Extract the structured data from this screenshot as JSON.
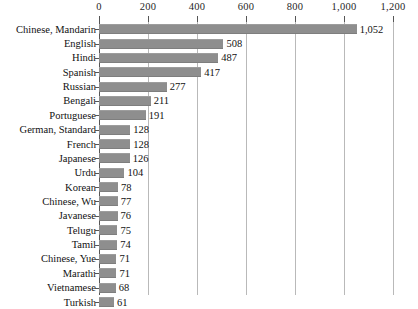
{
  "chart_data": {
    "type": "bar",
    "orientation": "horizontal",
    "title": "",
    "subtitle": "",
    "xlabel": "",
    "ylabel": "",
    "xlim": [
      0,
      1200
    ],
    "grid": true,
    "legend": null,
    "axis_position": "top",
    "value_labels_shown": true,
    "categories": [
      "Chinese, Mandarin",
      "English",
      "Hindi",
      "Spanish",
      "Russian",
      "Bengali",
      "Portuguese",
      "German, Standard",
      "French",
      "Japanese",
      "Urdu",
      "Korean",
      "Chinese, Wu",
      "Javanese",
      "Telugu",
      "Tamil",
      "Chinese, Yue",
      "Marathi",
      "Vietnamese",
      "Turkish"
    ],
    "values": [
      1052,
      508,
      487,
      417,
      277,
      211,
      191,
      128,
      128,
      126,
      104,
      78,
      77,
      76,
      75,
      74,
      71,
      71,
      68,
      61
    ],
    "value_labels": [
      "1,052",
      "508",
      "487",
      "417",
      "277",
      "211",
      "191",
      "128",
      "128",
      "126",
      "104",
      "78",
      "77",
      "76",
      "75",
      "74",
      "71",
      "71",
      "68",
      "61"
    ],
    "ticks": [
      0,
      200,
      400,
      600,
      800,
      1000,
      1200
    ],
    "tick_labels": [
      "0",
      "200",
      "400",
      "600",
      "800",
      "1,000",
      "1,200"
    ],
    "colors": {
      "bar": "#8e8e8e",
      "grid": "#b9b9b9",
      "axis": "#555555",
      "text": "#111111",
      "background": "#ffffff"
    }
  }
}
